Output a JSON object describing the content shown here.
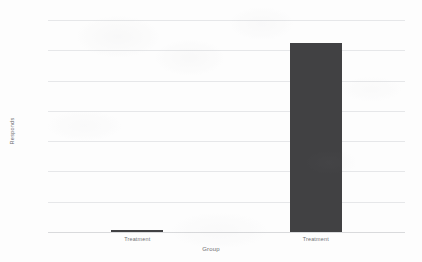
{
  "chart_data": {
    "type": "bar",
    "title": "",
    "xlabel": "Group",
    "ylabel": "Responds",
    "categories": [
      "Treatment",
      "Treatment"
    ],
    "values": [
      15,
      1250
    ],
    "ylim": [
      0,
      1400
    ],
    "ytick_labels": [
      "0",
      "200",
      "400",
      "600",
      "800",
      "1000",
      "1200",
      "1400"
    ],
    "ytick_values": [
      0,
      200,
      400,
      600,
      800,
      1000,
      1200,
      1400
    ],
    "ystep": 200,
    "grid": "horizontal",
    "legend": "none",
    "bar_color": "#414143",
    "gridline_color": "#e6e7e9",
    "background_color": "#fdfdfd",
    "text_color": "#6e6e72"
  }
}
